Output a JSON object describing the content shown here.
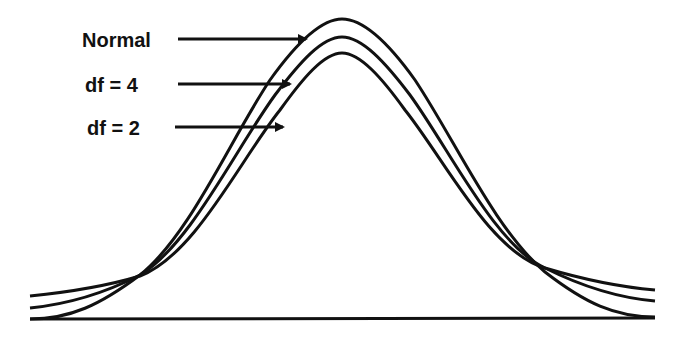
{
  "diagram": {
    "title": "",
    "type": "distribution-comparison",
    "labels": [
      {
        "text": "Normal",
        "x": 82,
        "y": 30,
        "arrow_from": [
          178,
          39
        ],
        "arrow_to": [
          306,
          39
        ]
      },
      {
        "text": "df = 4",
        "x": 85,
        "y": 75,
        "arrow_from": [
          178,
          84
        ],
        "arrow_to": [
          290,
          84
        ]
      },
      {
        "text": "df = 2",
        "x": 87,
        "y": 118,
        "arrow_from": [
          175,
          127
        ],
        "arrow_to": [
          283,
          127
        ]
      }
    ],
    "curves": [
      {
        "name": "Normal",
        "peak_y": 19,
        "tail_y": 319,
        "role": "normal-distribution"
      },
      {
        "name": "df = 4",
        "peak_y": 37,
        "tail_y": 308,
        "role": "t-distribution-df4"
      },
      {
        "name": "df = 2",
        "peak_y": 53,
        "tail_y": 296,
        "role": "t-distribution-df2"
      }
    ],
    "baseline": {
      "x1": 30,
      "x2": 655,
      "y": 319
    },
    "colors": {
      "stroke": "#111111",
      "background": "#ffffff"
    }
  }
}
